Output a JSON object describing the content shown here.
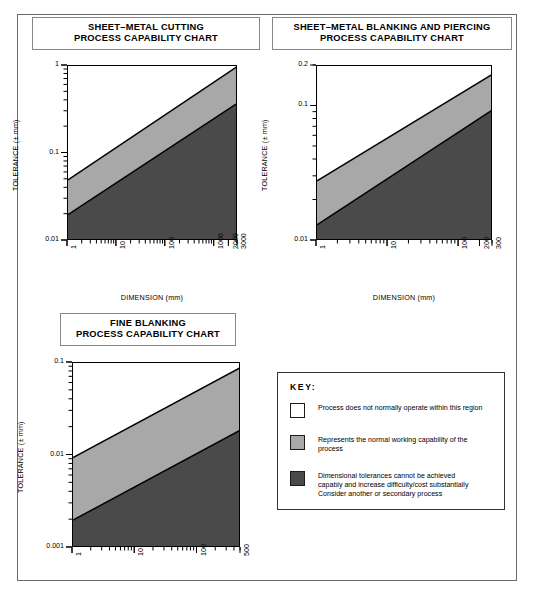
{
  "document": {
    "title": "Process Capability Charts"
  },
  "charts": [
    {
      "id": "sheet-metal-cutting",
      "title_line1": "SHEET–METAL CUTTING",
      "title_line2": "PROCESS CAPABILITY CHART",
      "xlabel": "DIMENSION (mm)",
      "ylabel": "TOLERANCE (± mm)",
      "chart_data": {
        "type": "area",
        "title": "SHEET–METAL CUTTING PROCESS CAPABILITY CHART",
        "xlabel": "DIMENSION (mm)",
        "ylabel": "TOLERANCE (± mm)",
        "xscale": "log",
        "yscale": "log",
        "xlim": [
          1,
          3000
        ],
        "ylim": [
          0.01,
          1
        ],
        "grid": false,
        "legend": "external-key",
        "xticks": [
          1,
          10,
          100,
          1000,
          2000,
          3000
        ],
        "xticklabels": [
          "1",
          "10",
          "100",
          "1000",
          "2000",
          "3000"
        ],
        "yticks": [
          0.01,
          0.1,
          1
        ],
        "yticklabels": [
          "0.01",
          "0.1",
          "1"
        ],
        "series": [
          {
            "name": "upper boundary (white / grey divide)",
            "x": [
              1,
              3000
            ],
            "y": [
              0.05,
              1.0
            ]
          },
          {
            "name": "lower boundary (grey / dark divide)",
            "x": [
              1,
              3000
            ],
            "y": [
              0.02,
              0.38
            ]
          }
        ],
        "bands": [
          {
            "name": "not normally operated",
            "fill": "#ffffff"
          },
          {
            "name": "normal working capability",
            "fill": "#a8a8a8"
          },
          {
            "name": "difficult / costly",
            "fill": "#4a4a4a"
          }
        ]
      }
    },
    {
      "id": "sheet-metal-blanking-and-piercing",
      "title_line1": "SHEET–METAL BLANKING AND PIERCING",
      "title_line2": "PROCESS CAPABILITY CHART",
      "xlabel": "DIMENSION (mm)",
      "ylabel": "TOLERANCE (± mm)",
      "chart_data": {
        "type": "area",
        "title": "SHEET–METAL BLANKING AND PIERCING PROCESS CAPABILITY CHART",
        "xlabel": "DIMENSION (mm)",
        "ylabel": "TOLERANCE (± mm)",
        "xscale": "log",
        "yscale": "log",
        "xlim": [
          1,
          300
        ],
        "ylim": [
          0.01,
          0.2
        ],
        "grid": false,
        "legend": "external-key",
        "xticks": [
          1,
          10,
          100,
          200,
          300
        ],
        "xticklabels": [
          "1",
          "10",
          "100",
          "200",
          "300"
        ],
        "yticks": [
          0.01,
          0.1,
          0.2
        ],
        "yticklabels": [
          "0.01",
          "0.1",
          "0.2"
        ],
        "series": [
          {
            "name": "upper boundary (white / grey divide)",
            "x": [
              1,
              300
            ],
            "y": [
              0.028,
              0.175
            ]
          },
          {
            "name": "lower boundary (grey / dark divide)",
            "x": [
              1,
              300
            ],
            "y": [
              0.0132,
              0.095
            ]
          }
        ],
        "bands": [
          {
            "name": "not normally operated",
            "fill": "#ffffff"
          },
          {
            "name": "normal working capability",
            "fill": "#a8a8a8"
          },
          {
            "name": "difficult / costly",
            "fill": "#4a4a4a"
          }
        ]
      }
    },
    {
      "id": "fine-blanking",
      "title_line1": "FINE BLANKING",
      "title_line2": "PROCESS CAPABILITY CHART",
      "xlabel": "DIMENSION (mm)",
      "ylabel": "TOLERANCE (± mm)",
      "chart_data": {
        "type": "area",
        "title": "FINE BLANKING PROCESS CAPABILITY CHART",
        "xlabel": "DIMENSION (mm)",
        "ylabel": "TOLERANCE (± mm)",
        "xscale": "log",
        "yscale": "log",
        "xlim": [
          1,
          500
        ],
        "ylim": [
          0.001,
          0.1
        ],
        "grid": false,
        "legend": "external-key",
        "xticks": [
          1,
          10,
          100,
          500
        ],
        "xticklabels": [
          "1",
          "10",
          "100",
          "500"
        ],
        "yticks": [
          0.001,
          0.01,
          0.1
        ],
        "yticklabels": [
          "0.001",
          "0.01",
          "0.1"
        ],
        "series": [
          {
            "name": "upper boundary (white / grey divide)",
            "x": [
              1,
              500
            ],
            "y": [
              0.0095,
              0.09
            ]
          },
          {
            "name": "lower boundary (grey / dark divide)",
            "x": [
              1,
              500
            ],
            "y": [
              0.002,
              0.019
            ]
          }
        ],
        "bands": [
          {
            "name": "not normally operated",
            "fill": "#ffffff"
          },
          {
            "name": "normal working capability",
            "fill": "#a8a8a8"
          },
          {
            "name": "difficult / costly",
            "fill": "#4a4a4a"
          }
        ]
      }
    }
  ],
  "key": {
    "title": "KEY:",
    "entries": [
      {
        "color": "#ffffff",
        "text": "Process does not normally operate within this region"
      },
      {
        "color": "#a8a8a8",
        "text": "Represents the normal working capability of the\nprocess"
      },
      {
        "color": "#4a4a4a",
        "text": "Dimensional tolerances cannot be achieved\ncapably and increase difficulty/cost substantially\nConsider another or secondary process"
      }
    ]
  },
  "colors": {
    "band_white": "#ffffff",
    "band_light": "#a8a8a8",
    "band_dark": "#4a4a4a",
    "frame": "#6b6b6b",
    "axis": "#000000"
  }
}
